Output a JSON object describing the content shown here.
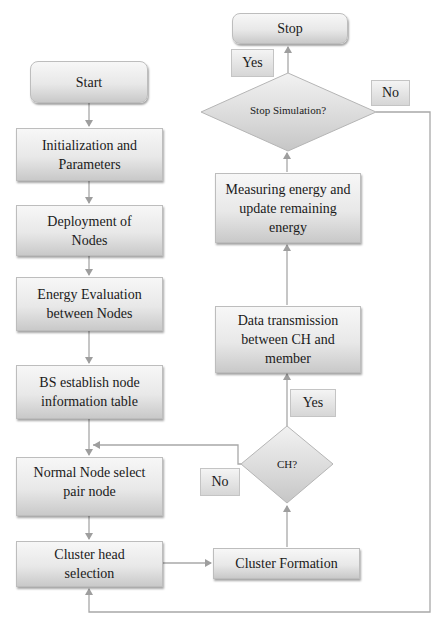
{
  "flowchart": {
    "nodes": {
      "start": "Start",
      "init": "Initialization and Parameters",
      "deploy": "Deployment of Nodes",
      "energy_eval": "Energy Evaluation between Nodes",
      "bs_table": "BS establish node information table",
      "normal_node": "Normal Node select pair node",
      "ch_selection": "Cluster head selection",
      "cluster_formation": "Cluster Formation",
      "ch_decision": "CH?",
      "data_tx": "Data transmission between CH and member",
      "measure": "Measuring energy and update remaining energy",
      "stop_decision": "Stop Simulation?",
      "stop": "Stop"
    },
    "labels": {
      "ch_yes": "Yes",
      "ch_no": "No",
      "stop_yes": "Yes",
      "stop_no": "No"
    }
  }
}
